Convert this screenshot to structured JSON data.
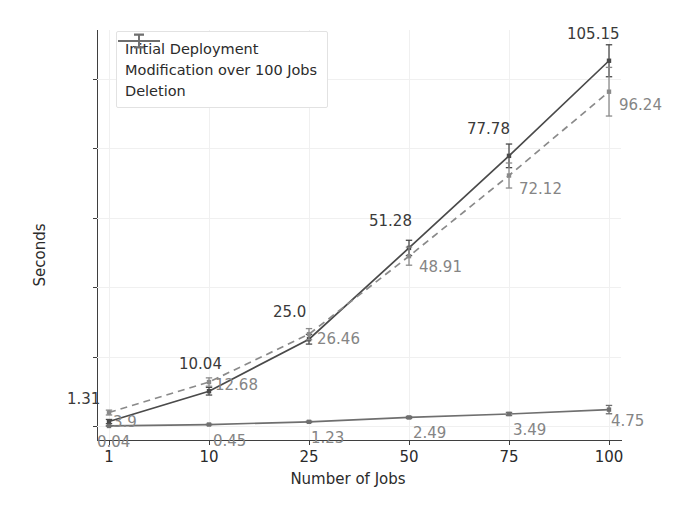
{
  "chart_data": {
    "type": "line",
    "title": "",
    "xlabel": "Number of Jobs",
    "ylabel": "Seconds",
    "categories": [
      "1",
      "10",
      "25",
      "50",
      "75",
      "100"
    ],
    "xticks": [
      "1",
      "10",
      "25",
      "50",
      "75",
      "100"
    ],
    "yticks": [
      "0",
      "20",
      "40",
      "60",
      "80",
      "100"
    ],
    "ylim": [
      -4,
      114
    ],
    "grid": true,
    "legend_position": "upper left",
    "series": [
      {
        "name": "Initial Deployment",
        "style": "solid",
        "color": "#4a4a4a",
        "label_color": "#3a3a3a",
        "values": [
          1.31,
          10.04,
          25.0,
          51.28,
          77.78,
          105.15
        ],
        "errors": [
          0.6,
          1.1,
          1.4,
          2.2,
          3.4,
          4.6
        ],
        "point_labels": [
          "1.31",
          "10.04",
          "25.0",
          "51.28",
          "77.78",
          "105.15"
        ]
      },
      {
        "name": "Modification over 100 Jobs",
        "style": "dashed",
        "color": "#8a8a8a",
        "label_color": "#858585",
        "values": [
          3.9,
          12.68,
          26.46,
          48.91,
          72.12,
          96.24
        ],
        "errors": [
          0.7,
          1.2,
          1.6,
          2.6,
          3.6,
          7.0
        ],
        "point_labels": [
          "3.9",
          "12.68",
          "26.46",
          "48.91",
          "72.12",
          "96.24"
        ]
      },
      {
        "name": "Deletion",
        "style": "solid",
        "color": "#6f6f6f",
        "label_color": "#858585",
        "values": [
          0.04,
          0.45,
          1.23,
          2.49,
          3.49,
          4.75
        ],
        "errors": [
          0.05,
          0.1,
          0.2,
          0.3,
          0.45,
          1.2
        ],
        "point_labels": [
          "0.04",
          "0.45",
          "1.23",
          "2.49",
          "3.49",
          "4.75"
        ]
      }
    ]
  },
  "legend": {
    "items": [
      {
        "label": "Initial Deployment"
      },
      {
        "label": "Modification over 100 Jobs"
      },
      {
        "label": "Deletion"
      }
    ]
  },
  "axes": {
    "x_title": "Number of Jobs",
    "y_title": "Seconds"
  }
}
